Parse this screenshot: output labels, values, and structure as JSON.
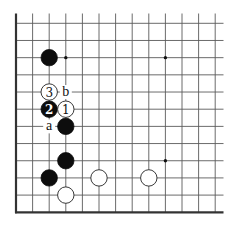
{
  "diagram": {
    "type": "go-board-partial",
    "columns": 13,
    "rows": 12,
    "edges": [
      "left",
      "bottom"
    ],
    "geometry": {
      "origin_x": 16,
      "origin_y": 23.3,
      "col_spacing": 16.6,
      "row_spacing": 17.18,
      "line_top": 13.5,
      "line_right": 223.5,
      "stone_radius": 8.2,
      "star_radius": 1.7
    },
    "colors": {
      "black_stone": "#0d0d0d",
      "white_stone": "#ffffff",
      "grid": "#5a5a5a",
      "edge": "#333333"
    },
    "star_points": [
      {
        "col": 3,
        "row": 2
      },
      {
        "col": 9,
        "row": 2
      },
      {
        "col": 9,
        "row": 8
      },
      {
        "col": 3,
        "row": 8
      }
    ],
    "stones": [
      {
        "color": "black",
        "col": 2,
        "row": 2,
        "label": ""
      },
      {
        "color": "white",
        "col": 2,
        "row": 4,
        "label": "3"
      },
      {
        "color": "black",
        "col": 2,
        "row": 5,
        "label": "2"
      },
      {
        "color": "white",
        "col": 3,
        "row": 5,
        "label": "1"
      },
      {
        "color": "black",
        "col": 3,
        "row": 6,
        "label": ""
      },
      {
        "color": "black",
        "col": 3,
        "row": 8,
        "label": ""
      },
      {
        "color": "black",
        "col": 2,
        "row": 9,
        "label": ""
      },
      {
        "color": "white",
        "col": 5,
        "row": 9,
        "label": ""
      },
      {
        "color": "white",
        "col": 8,
        "row": 9,
        "label": ""
      },
      {
        "color": "white",
        "col": 3,
        "row": 10,
        "label": ""
      }
    ],
    "point_labels": [
      {
        "text": "b",
        "col": 3,
        "row": 4
      },
      {
        "text": "a",
        "col": 2,
        "row": 6
      }
    ]
  }
}
